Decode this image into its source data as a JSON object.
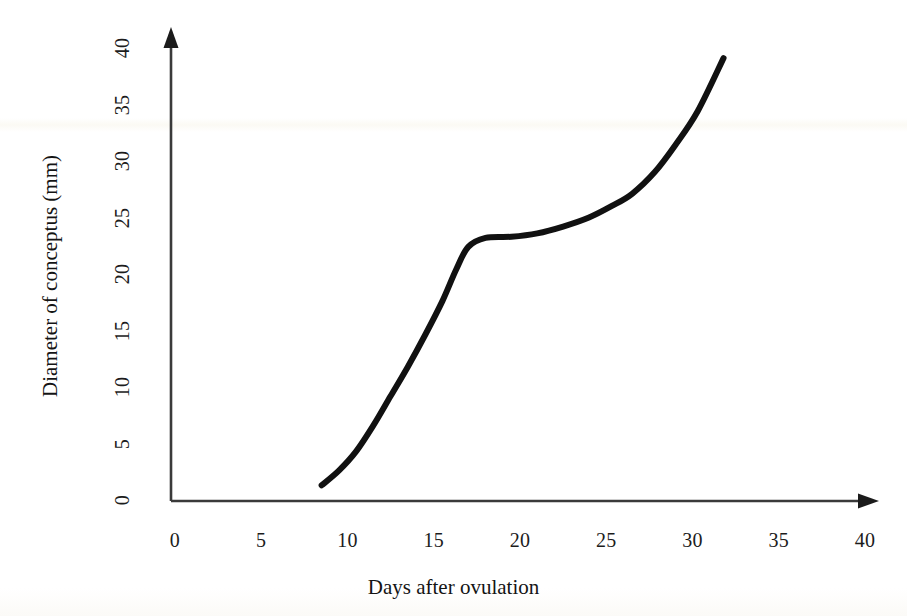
{
  "chart_data": {
    "type": "line",
    "title": "",
    "xlabel": "Days after ovulation",
    "ylabel": "Diameter of conceptus (mm)",
    "xlim": [
      0,
      40
    ],
    "ylim": [
      0,
      40
    ],
    "xticks": [
      "0",
      "5",
      "10",
      "15",
      "20",
      "25",
      "30",
      "35",
      "40"
    ],
    "yticks": [
      "0",
      "5",
      "10",
      "15",
      "20",
      "25",
      "30",
      "35",
      "40"
    ],
    "xtick_values": [
      0,
      5,
      10,
      15,
      20,
      25,
      30,
      35,
      40
    ],
    "ytick_values": [
      0,
      5,
      10,
      15,
      20,
      25,
      30,
      35,
      40
    ],
    "grid": false,
    "legend": null,
    "series": [
      {
        "name": "Diameter of conceptus",
        "color": "#111111",
        "line_width_px": 6,
        "x": [
          8.5,
          9.5,
          10.5,
          11.5,
          12.5,
          13.5,
          14.5,
          15.5,
          16.3,
          17.0,
          18.0,
          19.5,
          21.0,
          22.5,
          24.0,
          25.3,
          26.5,
          27.8,
          29.0,
          30.3,
          31.8
        ],
        "y": [
          1.3,
          2.6,
          4.3,
          6.6,
          9.2,
          11.8,
          14.6,
          17.6,
          20.4,
          22.4,
          23.2,
          23.3,
          23.6,
          24.2,
          25.0,
          26.0,
          27.1,
          29.0,
          31.4,
          34.4,
          39.1
        ]
      }
    ],
    "annotations": [],
    "axis_style": {
      "x_axis_arrow": true,
      "y_axis_arrow": true,
      "axis_color": "#3a3a3a",
      "ticks_drawn": false
    }
  },
  "axes": {
    "x_title": "Days after ovulation",
    "y_title": "Diameter of conceptus (mm)"
  },
  "icons": {
    "x_axis_arrow": "arrow-right-icon",
    "y_axis_arrow": "arrow-up-icon"
  }
}
